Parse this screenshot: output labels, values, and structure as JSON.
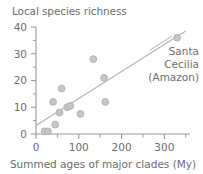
{
  "chart_data": {
    "type": "scatter",
    "title": "Local species richness",
    "xlabel": "Summed ages of major clades (My)",
    "ylabel": "Local species richness",
    "xlim": [
      0,
      360
    ],
    "ylim": [
      0,
      40
    ],
    "xticks": [
      0,
      100,
      200,
      300
    ],
    "xtick_labels": [
      "0",
      "100",
      "200",
      "300"
    ],
    "yticks": [
      0,
      10,
      20,
      30,
      40
    ],
    "ytick_labels": [
      "0",
      "10",
      "20",
      "30",
      "40"
    ],
    "x_minor_ticks": [
      50,
      150,
      250,
      350
    ],
    "y_minor_ticks": [
      5,
      15,
      25,
      35
    ],
    "grid": false,
    "legend": "none",
    "points": [
      {
        "x": 20,
        "y": 1,
        "label": ""
      },
      {
        "x": 28,
        "y": 1,
        "label": ""
      },
      {
        "x": 45,
        "y": 3.5,
        "label": ""
      },
      {
        "x": 40,
        "y": 12,
        "label": ""
      },
      {
        "x": 55,
        "y": 8,
        "label": ""
      },
      {
        "x": 60,
        "y": 17,
        "label": ""
      },
      {
        "x": 73,
        "y": 10,
        "label": ""
      },
      {
        "x": 80,
        "y": 10.5,
        "label": ""
      },
      {
        "x": 104,
        "y": 7.5,
        "label": ""
      },
      {
        "x": 134,
        "y": 28,
        "label": ""
      },
      {
        "x": 159,
        "y": 21,
        "label": ""
      },
      {
        "x": 162,
        "y": 12,
        "label": ""
      },
      {
        "x": 330,
        "y": 36,
        "label": "Santa Cecilia (Amazon)"
      }
    ],
    "trendline": {
      "x_start": 0,
      "y_start": 3.2,
      "x_end": 350,
      "y_end": 38.5
    },
    "annotation": {
      "lines": [
        "Santa",
        "Cecilia",
        "(Amazon)"
      ],
      "target_x": 330,
      "target_y": 36
    },
    "colors": {
      "marker_fill": "#c6c6c6",
      "marker_edge": "#b0b0b0",
      "trendline": "#b5b5b5",
      "axis": "#9a9a9a",
      "text": "#6e6e6e",
      "background": "#ffffff"
    }
  }
}
